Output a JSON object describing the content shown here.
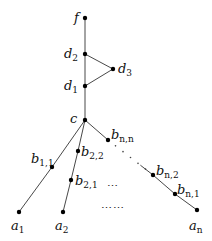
{
  "diagram": {
    "type": "tree-graph",
    "nodes": [
      {
        "id": "f",
        "label": "f",
        "sub": "",
        "x": 85,
        "y": 18,
        "lx": 74,
        "ly": 22
      },
      {
        "id": "d2",
        "label": "d",
        "sub": "2",
        "x": 85,
        "y": 54,
        "lx": 64,
        "ly": 58
      },
      {
        "id": "d3",
        "label": "d",
        "sub": "3",
        "x": 113,
        "y": 69,
        "lx": 118,
        "ly": 73
      },
      {
        "id": "d1",
        "label": "d",
        "sub": "1",
        "x": 85,
        "y": 86,
        "lx": 64,
        "ly": 90
      },
      {
        "id": "c",
        "label": "c",
        "sub": "",
        "x": 85,
        "y": 120,
        "lx": 70,
        "ly": 123
      },
      {
        "id": "bnn",
        "label": "b",
        "sub": "n,n",
        "x": 108,
        "y": 140,
        "lx": 111,
        "ly": 139
      },
      {
        "id": "b22",
        "label": "b",
        "sub": "2,2",
        "x": 78,
        "y": 151,
        "lx": 81,
        "ly": 156
      },
      {
        "id": "b11",
        "label": "b",
        "sub": "1,1",
        "x": 52,
        "y": 167,
        "lx": 31,
        "ly": 163
      },
      {
        "id": "b21",
        "label": "b",
        "sub": "2,1",
        "x": 71,
        "y": 180,
        "lx": 75,
        "ly": 185
      },
      {
        "id": "bn2",
        "label": "b",
        "sub": "n,2",
        "x": 153,
        "y": 175,
        "lx": 156,
        "ly": 175
      },
      {
        "id": "bn1",
        "label": "b",
        "sub": "n,1",
        "x": 175,
        "y": 194,
        "lx": 177,
        "ly": 194
      },
      {
        "id": "a1",
        "label": "a",
        "sub": "1",
        "x": 19,
        "y": 212,
        "lx": 11,
        "ly": 230
      },
      {
        "id": "a2",
        "label": "a",
        "sub": "2",
        "x": 63,
        "y": 212,
        "lx": 55,
        "ly": 230
      },
      {
        "id": "an",
        "label": "a",
        "sub": "n",
        "x": 197,
        "y": 210,
        "lx": 189,
        "ly": 230
      }
    ],
    "edges": [
      [
        "f",
        "d2"
      ],
      [
        "d2",
        "d1"
      ],
      [
        "d2",
        "d3"
      ],
      [
        "d3",
        "d1"
      ],
      [
        "d1",
        "c"
      ],
      [
        "c",
        "b11"
      ],
      [
        "b11",
        "a1"
      ],
      [
        "c",
        "b22"
      ],
      [
        "b22",
        "b21"
      ],
      [
        "b21",
        "a2"
      ],
      [
        "c",
        "bnn"
      ],
      [
        "bn2",
        "bn1"
      ],
      [
        "bn1",
        "an"
      ]
    ],
    "dotted_segment": {
      "from": "bnn",
      "to": "bn2"
    },
    "ellipses": [
      {
        "text": "⋯",
        "x": 107,
        "y": 190
      },
      {
        "text": "⋯⋯",
        "x": 101,
        "y": 212
      }
    ]
  }
}
